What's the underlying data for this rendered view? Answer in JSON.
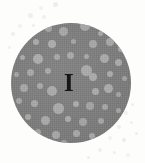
{
  "figure": {
    "label": "I",
    "label_position": {
      "x": 64,
      "y": 70
    },
    "label_font_size_px": 25,
    "background_color": "#fdfdfb",
    "canvas": {
      "width": 145,
      "height": 163
    },
    "description_kind": "micrograph-disc-with-inclusions"
  },
  "chart_data": {
    "type": "scatter",
    "title": "I",
    "xlabel": "",
    "ylabel": "",
    "xlim": [
      0,
      145
    ],
    "ylim": [
      0,
      163
    ],
    "grid": false,
    "legend_position": "none",
    "annotations": [
      "I"
    ],
    "disc": {
      "center_x": 71,
      "center_y": 83,
      "radius": 60,
      "fill_color": "#7d7d7d"
    },
    "inclusion_color": "#ababab",
    "speck_color": "#ececea",
    "inclusions": [
      {
        "cx": 48,
        "cy": 28,
        "r": 3.5
      },
      {
        "cx": 63,
        "cy": 31,
        "r": 4.5
      },
      {
        "cx": 85,
        "cy": 26,
        "r": 5.0
      },
      {
        "cx": 100,
        "cy": 33,
        "r": 2.5
      },
      {
        "cx": 36,
        "cy": 42,
        "r": 3.0
      },
      {
        "cx": 52,
        "cy": 44,
        "r": 4.0
      },
      {
        "cx": 73,
        "cy": 41,
        "r": 2.5
      },
      {
        "cx": 93,
        "cy": 44,
        "r": 4.0
      },
      {
        "cx": 110,
        "cy": 42,
        "r": 4.0
      },
      {
        "cx": 121,
        "cy": 49,
        "r": 3.0
      },
      {
        "cx": 22,
        "cy": 57,
        "r": 2.5
      },
      {
        "cx": 38,
        "cy": 59,
        "r": 5.0
      },
      {
        "cx": 57,
        "cy": 57,
        "r": 3.0
      },
      {
        "cx": 70,
        "cy": 55,
        "r": 3.5
      },
      {
        "cx": 86,
        "cy": 56,
        "r": 2.5
      },
      {
        "cx": 104,
        "cy": 58,
        "r": 4.5
      },
      {
        "cx": 118,
        "cy": 62,
        "r": 3.5
      },
      {
        "cx": 16,
        "cy": 74,
        "r": 2.5
      },
      {
        "cx": 30,
        "cy": 72,
        "r": 3.5
      },
      {
        "cx": 48,
        "cy": 71,
        "r": 3.0
      },
      {
        "cx": 86,
        "cy": 70,
        "r": 5.5
      },
      {
        "cx": 93,
        "cy": 77,
        "r": 4.0
      },
      {
        "cx": 110,
        "cy": 74,
        "r": 3.0
      },
      {
        "cx": 124,
        "cy": 78,
        "r": 2.5
      },
      {
        "cx": 24,
        "cy": 88,
        "r": 4.0
      },
      {
        "cx": 40,
        "cy": 86,
        "r": 3.0
      },
      {
        "cx": 52,
        "cy": 91,
        "r": 5.0
      },
      {
        "cx": 95,
        "cy": 91,
        "r": 3.5
      },
      {
        "cx": 108,
        "cy": 88,
        "r": 4.5
      },
      {
        "cx": 118,
        "cy": 94,
        "r": 2.5
      },
      {
        "cx": 19,
        "cy": 101,
        "r": 3.0
      },
      {
        "cx": 34,
        "cy": 103,
        "r": 3.5
      },
      {
        "cx": 58,
        "cy": 108,
        "r": 5.5
      },
      {
        "cx": 76,
        "cy": 104,
        "r": 3.0
      },
      {
        "cx": 90,
        "cy": 106,
        "r": 4.0
      },
      {
        "cx": 105,
        "cy": 107,
        "r": 3.0
      },
      {
        "cx": 118,
        "cy": 110,
        "r": 2.5
      },
      {
        "cx": 28,
        "cy": 117,
        "r": 3.0
      },
      {
        "cx": 45,
        "cy": 120,
        "r": 4.5
      },
      {
        "cx": 68,
        "cy": 119,
        "r": 3.0
      },
      {
        "cx": 83,
        "cy": 122,
        "r": 4.0
      },
      {
        "cx": 101,
        "cy": 121,
        "r": 3.0
      },
      {
        "cx": 38,
        "cy": 132,
        "r": 3.0
      },
      {
        "cx": 56,
        "cy": 135,
        "r": 4.0
      },
      {
        "cx": 76,
        "cy": 133,
        "r": 3.5
      },
      {
        "cx": 92,
        "cy": 136,
        "r": 3.0
      },
      {
        "cx": 64,
        "cy": 143,
        "r": 3.0
      }
    ],
    "specks": [
      {
        "cx": 41,
        "cy": 8,
        "r": 2.0
      },
      {
        "cx": 55,
        "cy": 4,
        "r": 2.5
      },
      {
        "cx": 30,
        "cy": 15,
        "r": 2.5
      },
      {
        "cx": 44,
        "cy": 17,
        "r": 2.0
      },
      {
        "cx": 20,
        "cy": 26,
        "r": 2.0
      },
      {
        "cx": 33,
        "cy": 25,
        "r": 1.5
      },
      {
        "cx": 13,
        "cy": 34,
        "r": 2.0
      },
      {
        "cx": 9,
        "cy": 47,
        "r": 1.5
      },
      {
        "cx": 126,
        "cy": 113,
        "r": 2.0
      },
      {
        "cx": 132,
        "cy": 104,
        "r": 1.5
      },
      {
        "cx": 119,
        "cy": 127,
        "r": 2.0
      },
      {
        "cx": 131,
        "cy": 122,
        "r": 1.5
      },
      {
        "cx": 110,
        "cy": 138,
        "r": 2.0
      },
      {
        "cx": 124,
        "cy": 140,
        "r": 2.0
      },
      {
        "cx": 136,
        "cy": 133,
        "r": 1.5
      },
      {
        "cx": 100,
        "cy": 150,
        "r": 2.0
      },
      {
        "cx": 114,
        "cy": 152,
        "r": 1.5
      },
      {
        "cx": 128,
        "cy": 155,
        "r": 2.0
      },
      {
        "cx": 88,
        "cy": 157,
        "r": 1.5
      }
    ]
  }
}
